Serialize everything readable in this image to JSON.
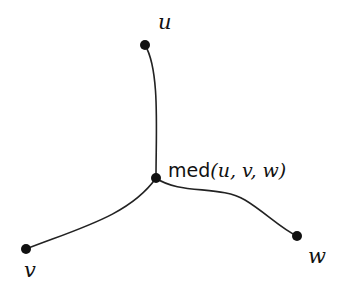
{
  "diagram": {
    "nodes": [
      {
        "id": "u",
        "label": "u",
        "x": 145,
        "y": 45
      },
      {
        "id": "v",
        "label": "v",
        "x": 26,
        "y": 249
      },
      {
        "id": "w",
        "label": "w",
        "x": 297,
        "y": 236
      },
      {
        "id": "m",
        "label_func": "med",
        "label_args": "(u, v, w)",
        "x": 156,
        "y": 178
      }
    ],
    "edges": [
      {
        "from": "m",
        "to": "u"
      },
      {
        "from": "m",
        "to": "v"
      },
      {
        "from": "m",
        "to": "w"
      }
    ],
    "colors": {
      "stroke": "#222222",
      "node": "#111111"
    }
  }
}
